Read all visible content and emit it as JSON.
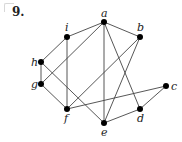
{
  "problem": {
    "number": "9."
  },
  "graph": {
    "nodes": [
      {
        "id": "a",
        "x": 104,
        "y": 22,
        "lx": 101,
        "ly": 17
      },
      {
        "id": "b",
        "x": 140,
        "y": 37,
        "lx": 137,
        "ly": 31
      },
      {
        "id": "c",
        "x": 166,
        "y": 86,
        "lx": 171,
        "ly": 90
      },
      {
        "id": "d",
        "x": 140,
        "y": 109,
        "lx": 137,
        "ly": 122
      },
      {
        "id": "e",
        "x": 104,
        "y": 123,
        "lx": 101,
        "ly": 136
      },
      {
        "id": "f",
        "x": 67,
        "y": 109,
        "lx": 64,
        "ly": 122
      },
      {
        "id": "g",
        "x": 41,
        "y": 84,
        "lx": 31,
        "ly": 88
      },
      {
        "id": "h",
        "x": 41,
        "y": 62,
        "lx": 31,
        "ly": 66
      },
      {
        "id": "i",
        "x": 67,
        "y": 37,
        "lx": 65,
        "ly": 31
      }
    ],
    "edges": [
      [
        "a",
        "i"
      ],
      [
        "a",
        "b"
      ],
      [
        "a",
        "g"
      ],
      [
        "a",
        "e"
      ],
      [
        "a",
        "d"
      ],
      [
        "i",
        "h"
      ],
      [
        "i",
        "f"
      ],
      [
        "b",
        "f"
      ],
      [
        "b",
        "e"
      ],
      [
        "h",
        "g"
      ],
      [
        "h",
        "e"
      ],
      [
        "g",
        "f"
      ],
      [
        "f",
        "c"
      ],
      [
        "c",
        "d"
      ],
      [
        "d",
        "e"
      ]
    ]
  }
}
